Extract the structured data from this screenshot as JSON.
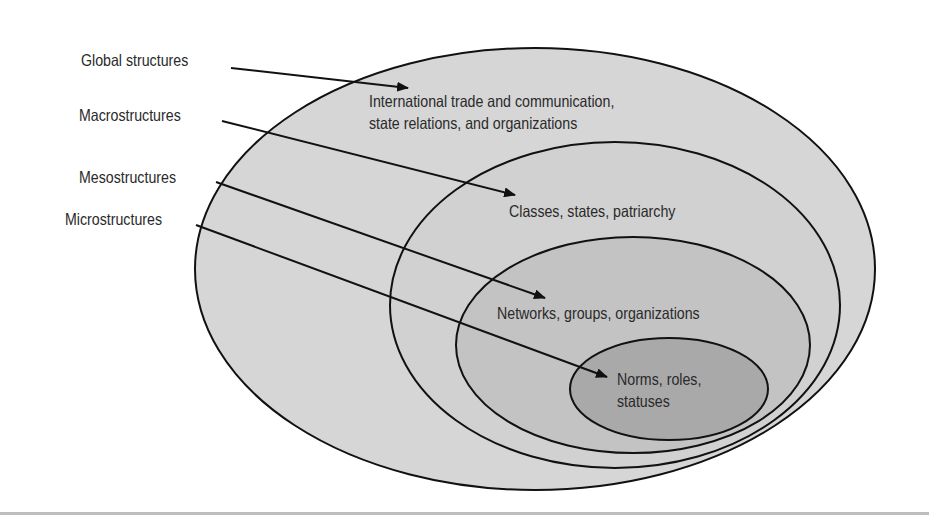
{
  "diagram": {
    "type": "nested-ellipses",
    "levels": [
      {
        "name": "Global structures",
        "description_lines": [
          "International trade and communication,",
          "state relations, and organizations"
        ],
        "fill": "#d6d6d6"
      },
      {
        "name": "Macrostructures",
        "description_lines": [
          "Classes, states, patriarchy"
        ],
        "fill": "#d0d0d0"
      },
      {
        "name": "Mesostructures",
        "description_lines": [
          "Networks, groups, organizations"
        ],
        "fill": "#c2c2c2"
      },
      {
        "name": "Microstructures",
        "description_lines": [
          "Norms, roles,",
          "statuses"
        ],
        "fill": "#a9a9a9"
      }
    ],
    "outline_color": "#111111",
    "footer_rule_color": "#bdbdbd"
  }
}
